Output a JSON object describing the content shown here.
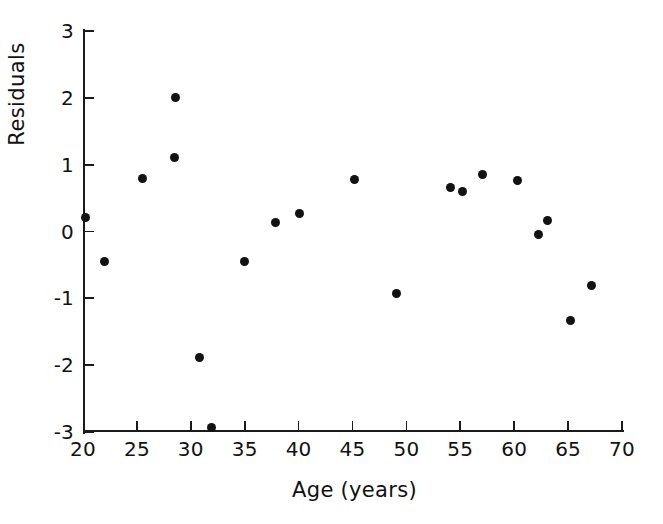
{
  "chart_data": {
    "type": "scatter",
    "title": "",
    "xlabel": "Age (years)",
    "ylabel": "Residuals",
    "xlim": [
      20,
      70
    ],
    "ylim": [
      -3,
      3
    ],
    "xticks": [
      20,
      25,
      30,
      35,
      40,
      45,
      50,
      55,
      60,
      65,
      70
    ],
    "xtick_labels": [
      "20",
      "25",
      "30",
      "35",
      "40",
      "45",
      "50",
      "55",
      "60",
      "65",
      "70"
    ],
    "yticks": [
      -3,
      -2,
      -1,
      0,
      1,
      2,
      3
    ],
    "ytick_labels": [
      "-3",
      "-2",
      "-1",
      "0",
      "1",
      "2",
      "3"
    ],
    "grid": false,
    "legend": null,
    "marker": "filled-circle",
    "marker_color": "#121212",
    "background_color": "#ffffff",
    "axis_color": "#1a1a1a",
    "n_points": 20,
    "points": [
      {
        "x": 20.2,
        "y": 0.21
      },
      {
        "x": 22.0,
        "y": -0.45
      },
      {
        "x": 25.5,
        "y": 0.8
      },
      {
        "x": 28.5,
        "y": 1.1
      },
      {
        "x": 28.6,
        "y": 2.0
      },
      {
        "x": 30.8,
        "y": -1.88
      },
      {
        "x": 31.9,
        "y": -2.94
      },
      {
        "x": 35.0,
        "y": -0.45
      },
      {
        "x": 37.9,
        "y": 0.13
      },
      {
        "x": 40.1,
        "y": 0.27
      },
      {
        "x": 45.2,
        "y": 0.78
      },
      {
        "x": 49.1,
        "y": -0.93
      },
      {
        "x": 54.1,
        "y": 0.66
      },
      {
        "x": 55.2,
        "y": 0.6
      },
      {
        "x": 57.1,
        "y": 0.85
      },
      {
        "x": 60.3,
        "y": 0.76
      },
      {
        "x": 62.3,
        "y": -0.04
      },
      {
        "x": 63.1,
        "y": 0.17
      },
      {
        "x": 65.2,
        "y": -1.33
      },
      {
        "x": 67.2,
        "y": -0.81
      }
    ]
  }
}
